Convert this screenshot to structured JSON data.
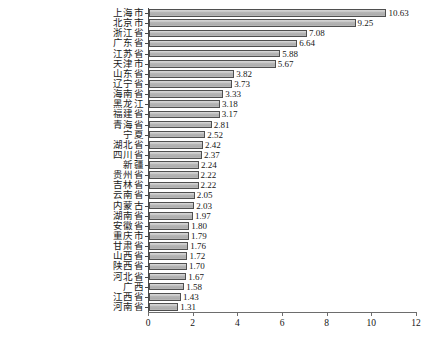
{
  "chart_data": {
    "type": "bar",
    "orientation": "horizontal",
    "title": "",
    "subtitle": "",
    "xlabel": "",
    "ylabel": "",
    "xlim": [
      0,
      12
    ],
    "xticks": [
      "0",
      "2",
      "4",
      "6",
      "8",
      "10",
      "12"
    ],
    "xtick_values": [
      0,
      2,
      4,
      6,
      8,
      10,
      12
    ],
    "grid": false,
    "legend": null,
    "value_label_format": "0.00",
    "categories": [
      "上海市",
      "北京市",
      "浙江省",
      "广东省",
      "江苏省",
      "天津市",
      "山东省",
      "辽宁省",
      "海南省",
      "黑龙江",
      "福建省",
      "青海省",
      "宁夏",
      "湖北省",
      "四川省",
      "新疆",
      "贵州省",
      "吉林省",
      "云南省",
      "内蒙古",
      "湖南省",
      "安徽省",
      "重庆市",
      "甘肃省",
      "山西省",
      "陕西省",
      "河北省",
      "广西",
      "江西省",
      "河南省"
    ],
    "values": [
      10.63,
      9.25,
      7.08,
      6.64,
      5.88,
      5.67,
      3.82,
      3.73,
      3.33,
      3.18,
      3.17,
      2.81,
      2.52,
      2.42,
      2.37,
      2.24,
      2.22,
      2.22,
      2.05,
      2.03,
      1.97,
      1.8,
      1.79,
      1.76,
      1.72,
      1.7,
      1.67,
      1.58,
      1.43,
      1.31
    ],
    "value_labels": [
      "10.63",
      "9.25",
      "7.08",
      "6.64",
      "5.88",
      "5.67",
      "3.82",
      "3.73",
      "3.33",
      "3.18",
      "3.17",
      "2.81",
      "2.52",
      "2.42",
      "2.37",
      "2.24",
      "2.22",
      "2.22",
      "2.05",
      "2.03",
      "1.97",
      "1.80",
      "1.79",
      "1.76",
      "1.72",
      "1.70",
      "1.67",
      "1.58",
      "1.43",
      "1.31"
    ],
    "colors": {
      "bar_fill": "#b6b6b6",
      "bar_border": "#4f4f4f",
      "axis": "#4a4a4a",
      "text": "#1a1a1a",
      "background": "#ffffff"
    }
  }
}
